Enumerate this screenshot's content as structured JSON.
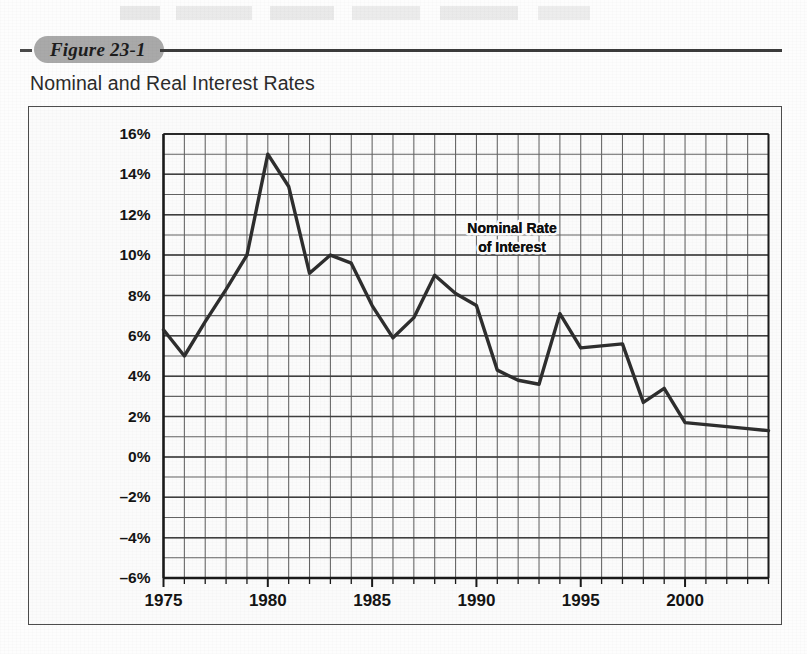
{
  "figure": {
    "badge": "Figure 23-1",
    "title": "Nominal and Real Interest Rates"
  },
  "annotation": {
    "line1": "Nominal Rate",
    "line2": "of Interest"
  },
  "colors": {
    "line": "#2e2e2e",
    "grid": "#636363",
    "axis": "#1a1a1a",
    "badge_bg": "#a9a9a9",
    "panel_bg": "#fbfbfb",
    "text": "#141414"
  },
  "chart_data": {
    "type": "line",
    "title": "Nominal and Real Interest Rates",
    "xlabel": "",
    "ylabel": "",
    "grid": true,
    "legend": "annotation",
    "xlim": [
      1975,
      2004
    ],
    "ylim": [
      -6,
      16
    ],
    "y_tick_step": 2,
    "y_ticks": [
      16,
      14,
      12,
      10,
      8,
      6,
      4,
      2,
      0,
      -2,
      -4,
      -6
    ],
    "y_tick_labels": [
      "16%",
      "14%",
      "12%",
      "10%",
      "8%",
      "6%",
      "4%",
      "2%",
      "0%",
      "–2%",
      "–4%",
      "–6%"
    ],
    "x_ticks": [
      1975,
      1980,
      1985,
      1990,
      1995,
      2000
    ],
    "x_tick_labels": [
      "1975",
      "1980",
      "1985",
      "1990",
      "1995",
      "2000"
    ],
    "x_minor_step": 1,
    "y_minor_step": 1,
    "series": [
      {
        "name": "Nominal Rate of Interest",
        "x": [
          1975,
          1976,
          1977,
          1978,
          1979,
          1980,
          1981,
          1982,
          1983,
          1984,
          1985,
          1986,
          1987,
          1988,
          1989,
          1990,
          1991,
          1992,
          1993,
          1994,
          1995,
          1996,
          1997,
          1998,
          1999,
          2000,
          2001,
          2002,
          2003,
          2004
        ],
        "values": [
          6.3,
          5.0,
          6.7,
          8.3,
          10.0,
          15.0,
          13.4,
          9.1,
          10.0,
          9.6,
          7.5,
          5.9,
          6.9,
          9.0,
          8.1,
          7.5,
          4.3,
          3.8,
          3.6,
          7.1,
          5.4,
          5.5,
          5.6,
          2.7,
          3.4,
          1.7,
          1.6,
          1.5,
          1.4,
          1.3
        ]
      }
    ]
  }
}
